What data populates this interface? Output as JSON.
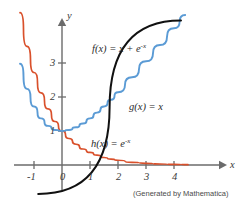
{
  "chart_data": {
    "type": "line",
    "title": "",
    "xlabel": "x",
    "ylabel": "y",
    "xlim": [
      -1.6,
      4.7
    ],
    "ylim": [
      -0.6,
      4.3
    ],
    "grid": false,
    "legend_position": "inline-annotations",
    "xticks": [
      "-1",
      "0",
      "1",
      "2",
      "3",
      "4"
    ],
    "xtick_values": [
      -1,
      0,
      1,
      2,
      3,
      4
    ],
    "yticks": [
      "1",
      "2",
      "3"
    ],
    "ytick_values": [
      1,
      2,
      3
    ],
    "series": [
      {
        "name": "f",
        "label": "f(x) = x + e",
        "label_exponent": "-x",
        "expression": "x + exp(-x)",
        "color": "#5b9bd5",
        "x": [
          -1.5,
          -1.25,
          -1.0,
          -0.75,
          -0.5,
          -0.25,
          0,
          0.25,
          0.5,
          0.75,
          1.0,
          1.25,
          1.5,
          1.75,
          2.0,
          2.5,
          3.0,
          3.5,
          4.0,
          4.4
        ],
        "values": [
          2.98,
          2.24,
          1.72,
          1.37,
          1.15,
          1.03,
          1.0,
          1.03,
          1.11,
          1.22,
          1.37,
          1.54,
          1.72,
          1.92,
          2.14,
          2.58,
          3.05,
          3.53,
          4.02,
          4.41
        ]
      },
      {
        "name": "g",
        "label": "g(x) = x",
        "expression": "x",
        "color": "#111111",
        "x": [
          -0.85,
          4.25
        ],
        "values": [
          -0.85,
          4.25
        ]
      },
      {
        "name": "h",
        "label": "h(x) = e",
        "label_exponent": "-x",
        "expression": "exp(-x)",
        "color": "#d9502b",
        "x": [
          -1.5,
          -1.25,
          -1.0,
          -0.75,
          -0.5,
          -0.25,
          0,
          0.25,
          0.5,
          0.75,
          1.0,
          1.25,
          1.5,
          1.75,
          2.0,
          2.5,
          3.0,
          3.5,
          4.0,
          4.5
        ],
        "values": [
          4.48,
          3.49,
          2.72,
          2.12,
          1.65,
          1.28,
          1.0,
          0.78,
          0.61,
          0.47,
          0.37,
          0.29,
          0.22,
          0.17,
          0.14,
          0.08,
          0.05,
          0.03,
          0.02,
          0.011
        ]
      }
    ],
    "annotations": [
      {
        "name": "f-label",
        "text": "f(x) = x + e",
        "exponent": "-x",
        "x_px": 92,
        "y_px": 44
      },
      {
        "name": "g-label",
        "text": "g(x) = x",
        "exponent": "",
        "x_px": 129,
        "y_px": 102
      },
      {
        "name": "h-label",
        "text": "h(x) = e",
        "exponent": "-x",
        "x_px": 91,
        "y_px": 139
      }
    ],
    "caption": "(Generated by Mathematica)"
  },
  "axes": {
    "x_axis_name": "x",
    "y_axis_name": "y"
  },
  "colors": {
    "f_curve": "#5b9bd5",
    "g_curve": "#111111",
    "h_curve": "#d9502b",
    "axis": "#6b6b6b",
    "background": "#ffffff"
  }
}
